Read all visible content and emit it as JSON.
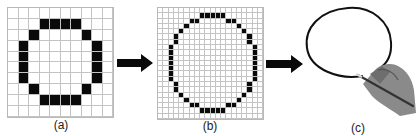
{
  "figure": {
    "panels": [
      {
        "id": "a",
        "label": "(a)",
        "description": "Low-resolution pixel circle",
        "grid": {
          "cols": 10,
          "rows": 10
        },
        "filled": [
          [
            1,
            3
          ],
          [
            1,
            4
          ],
          [
            1,
            5
          ],
          [
            1,
            6
          ],
          [
            2,
            2
          ],
          [
            2,
            7
          ],
          [
            3,
            1
          ],
          [
            3,
            8
          ],
          [
            4,
            1
          ],
          [
            4,
            8
          ],
          [
            5,
            1
          ],
          [
            5,
            8
          ],
          [
            6,
            1
          ],
          [
            6,
            8
          ],
          [
            7,
            2
          ],
          [
            7,
            7
          ],
          [
            8,
            3
          ],
          [
            8,
            4
          ],
          [
            8,
            5
          ],
          [
            8,
            6
          ]
        ]
      },
      {
        "id": "b",
        "label": "(b)",
        "description": "Higher-resolution pixel circle",
        "grid": {
          "cols": 20,
          "rows": 21
        },
        "filled": [
          [
            1,
            8
          ],
          [
            1,
            9
          ],
          [
            1,
            10
          ],
          [
            1,
            11
          ],
          [
            1,
            12
          ],
          [
            2,
            6
          ],
          [
            2,
            7
          ],
          [
            2,
            13
          ],
          [
            2,
            14
          ],
          [
            3,
            5
          ],
          [
            3,
            15
          ],
          [
            4,
            4
          ],
          [
            4,
            16
          ],
          [
            5,
            3
          ],
          [
            5,
            17
          ],
          [
            6,
            3
          ],
          [
            6,
            17
          ],
          [
            7,
            2
          ],
          [
            7,
            18
          ],
          [
            8,
            2
          ],
          [
            8,
            18
          ],
          [
            9,
            2
          ],
          [
            9,
            18
          ],
          [
            10,
            2
          ],
          [
            10,
            18
          ],
          [
            11,
            2
          ],
          [
            11,
            18
          ],
          [
            12,
            2
          ],
          [
            12,
            18
          ],
          [
            13,
            2
          ],
          [
            13,
            18
          ],
          [
            14,
            3
          ],
          [
            14,
            17
          ],
          [
            15,
            3
          ],
          [
            15,
            17
          ],
          [
            16,
            4
          ],
          [
            16,
            16
          ],
          [
            17,
            5
          ],
          [
            17,
            15
          ],
          [
            18,
            6
          ],
          [
            18,
            7
          ],
          [
            18,
            13
          ],
          [
            18,
            14
          ],
          [
            19,
            8
          ],
          [
            19,
            9
          ],
          [
            19,
            10
          ],
          [
            19,
            11
          ],
          [
            19,
            12
          ]
        ]
      },
      {
        "id": "c",
        "label": "(c)",
        "description": "Hand drawing a smooth continuous circle with a pencil"
      }
    ],
    "arrows": [
      {
        "from": "a",
        "to": "b",
        "icon": "right-arrow-icon"
      },
      {
        "from": "b",
        "to": "c",
        "icon": "right-arrow-icon"
      }
    ],
    "colors": {
      "pixel_on": "#0a0a0a",
      "grid_line": "#c4c4c4",
      "background": "#ffffff",
      "hand": "#8a8a8a"
    }
  }
}
